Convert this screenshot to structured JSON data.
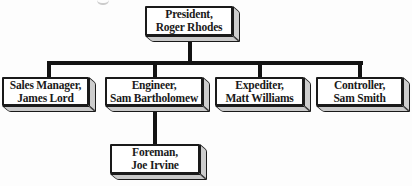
{
  "diagram": {
    "type": "org-chart",
    "nodes": {
      "president": {
        "title": "President,",
        "name": "Roger Rhodes"
      },
      "sales_manager": {
        "title": "Sales Manager,",
        "name": "James Lord"
      },
      "engineer": {
        "title": "Engineer,",
        "name": "Sam Bartholomew"
      },
      "expediter": {
        "title": "Expediter,",
        "name": "Matt Williams"
      },
      "controller": {
        "title": "Controller,",
        "name": "Sam Smith"
      },
      "foreman": {
        "title": "Foreman,",
        "name": "Joe Irvine"
      }
    },
    "edges": [
      {
        "from": "president",
        "to": "sales_manager"
      },
      {
        "from": "president",
        "to": "engineer"
      },
      {
        "from": "president",
        "to": "expediter"
      },
      {
        "from": "president",
        "to": "controller"
      },
      {
        "from": "engineer",
        "to": "foreman"
      }
    ],
    "colors": {
      "box_fill": "#ffffff",
      "side_fill": "#cdcdcd",
      "border": "#1a1a1a",
      "line": "#131313",
      "background": "#fdfdfd"
    }
  }
}
